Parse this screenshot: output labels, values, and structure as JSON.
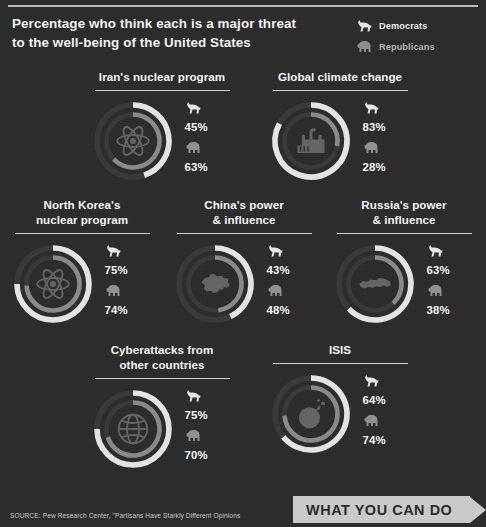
{
  "headline": "Percentage who think each is a major threat to the well-being of the United States",
  "headline_line1": "Percentage who think each is a major threat",
  "headline_line2": "to the well-being of the United States",
  "legend": {
    "democrats": {
      "label": "Democrats",
      "icon": "donkey-icon",
      "color": "#e3e3e3"
    },
    "republicans": {
      "label": "Republicans",
      "icon": "elephant-icon",
      "color": "#8f8f8f"
    }
  },
  "colors": {
    "background": "#2b2b2b",
    "democrat_arc": "#e3e3e3",
    "republican_arc": "#8a8a8a",
    "track": "#3a3a3a",
    "text": "#f4f4f4",
    "rule": "#cfcfcf",
    "cta_background": "#c9c9c9",
    "cta_text": "#2b2b2b"
  },
  "chart_data": {
    "type": "pie",
    "title": "Percentage who think each is a major threat to the well-being of the United States",
    "subtitle": "",
    "xlabel": "",
    "ylabel": "",
    "ylim": [
      0,
      100
    ],
    "legend_position": "top-right",
    "categories": [
      "Iran's nuclear program",
      "Global climate change",
      "North Korea's nuclear program",
      "China's power & influence",
      "Russia's power & influence",
      "Cyberattacks from other countries",
      "ISIS"
    ],
    "series": [
      {
        "name": "Democrats",
        "values": [
          45,
          83,
          75,
          43,
          63,
          75,
          64
        ]
      },
      {
        "name": "Republicans",
        "values": [
          63,
          28,
          74,
          48,
          38,
          70,
          74
        ]
      }
    ]
  },
  "charts": [
    {
      "title_line1": "Iran's nuclear program",
      "title_line2": "",
      "icon": "atom-icon",
      "democrat_value": 45,
      "republican_value": 63,
      "democrat_label": "45%",
      "republican_label": "63%"
    },
    {
      "title_line1": "Global climate change",
      "title_line2": "",
      "icon": "factory-icon",
      "democrat_value": 83,
      "republican_value": 28,
      "democrat_label": "83%",
      "republican_label": "28%"
    },
    {
      "title_line1": "North Korea's",
      "title_line2": "nuclear program",
      "icon": "atom-icon",
      "democrat_value": 75,
      "republican_value": 74,
      "democrat_label": "75%",
      "republican_label": "74%"
    },
    {
      "title_line1": "China's power",
      "title_line2": "& influence",
      "icon": "china-map-icon",
      "democrat_value": 43,
      "republican_value": 48,
      "democrat_label": "43%",
      "republican_label": "48%"
    },
    {
      "title_line1": "Russia's power",
      "title_line2": "& influence",
      "icon": "russia-map-icon",
      "democrat_value": 63,
      "republican_value": 38,
      "democrat_label": "63%",
      "republican_label": "38%"
    },
    {
      "title_line1": "Cyberattacks from",
      "title_line2": "other countries",
      "icon": "globe-icon",
      "democrat_value": 75,
      "republican_value": 70,
      "democrat_label": "75%",
      "republican_label": "70%"
    },
    {
      "title_line1": "ISIS",
      "title_line2": "",
      "icon": "bomb-icon",
      "democrat_value": 64,
      "republican_value": 74,
      "democrat_label": "64%",
      "republican_label": "74%"
    }
  ],
  "source": "SOURCE: Pew Research Center, \"Partisans Have Starkly Different Opinions",
  "cta": {
    "label": "WHAT YOU CAN DO"
  }
}
